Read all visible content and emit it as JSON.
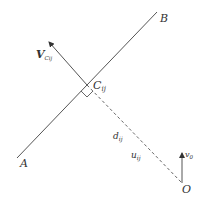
{
  "diagram": {
    "colors": {
      "stroke": "#555555",
      "text": "#333333",
      "background": "#ffffff"
    },
    "points": {
      "A": {
        "label": "A"
      },
      "B": {
        "label": "B"
      },
      "C": {
        "label": "C",
        "subscript": "ij"
      },
      "O": {
        "label": "O"
      }
    },
    "vectors": {
      "v_c": {
        "label": "V",
        "subscript": "Cij"
      },
      "v_0": {
        "label": "v",
        "subscript": "0"
      }
    },
    "segment_labels": {
      "d": {
        "label": "d",
        "subscript": "ij"
      },
      "u": {
        "label": "u",
        "subscript": "ij"
      }
    }
  }
}
